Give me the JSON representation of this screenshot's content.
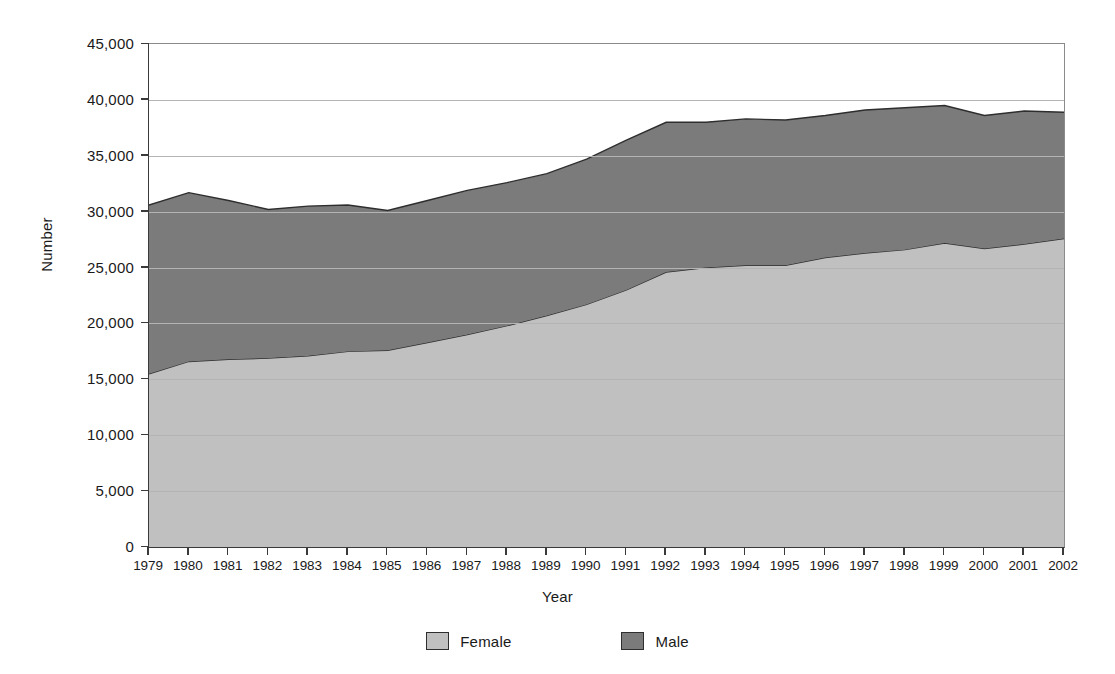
{
  "chart_data": {
    "type": "area",
    "stacked": true,
    "title": "",
    "xlabel": "Year",
    "ylabel": "Number",
    "grid": true,
    "legend_position": "bottom",
    "ylim": [
      0,
      45000
    ],
    "ytick_step": 5000,
    "ytick_labels": [
      "45,000",
      "40,000",
      "35,000",
      "30,000",
      "25,000",
      "20,000",
      "15,000",
      "10,000",
      "5,000",
      "0"
    ],
    "ytick_values": [
      45000,
      40000,
      35000,
      30000,
      25000,
      20000,
      15000,
      10000,
      5000,
      0
    ],
    "categories": [
      "1979",
      "1980",
      "1981",
      "1982",
      "1983",
      "1984",
      "1985",
      "1986",
      "1987",
      "1988",
      "1989",
      "1990",
      "1991",
      "1992",
      "1993",
      "1994",
      "1995",
      "1996",
      "1997",
      "1998",
      "1999",
      "2000",
      "2001",
      "2002"
    ],
    "series": [
      {
        "name": "Female",
        "color": "#c0c0c0",
        "values": [
          15500,
          16600,
          16800,
          16900,
          17100,
          17500,
          17600,
          18300,
          19000,
          19800,
          20700,
          21700,
          23000,
          24600,
          25000,
          25200,
          25200,
          25900,
          26300,
          26600,
          27200,
          26700,
          27100,
          27600
        ]
      },
      {
        "name": "Male",
        "color": "#7b7b7b",
        "values": [
          15100,
          15100,
          14200,
          13300,
          13400,
          13100,
          12500,
          12700,
          12900,
          12800,
          12700,
          13000,
          13400,
          13400,
          13000,
          13100,
          13000,
          12700,
          12800,
          12700,
          12300,
          11900,
          11900,
          11300
        ]
      }
    ],
    "totals": [
      30600,
      31700,
      31000,
      30200,
      30500,
      30600,
      30100,
      31000,
      31900,
      32600,
      33400,
      34700,
      36400,
      38000,
      38000,
      38300,
      38200,
      38600,
      39100,
      39300,
      39500,
      38600,
      39000,
      38900
    ]
  },
  "legend": {
    "items": [
      {
        "label": "Female",
        "color": "#c0c0c0"
      },
      {
        "label": "Male",
        "color": "#7b7b7b"
      }
    ]
  },
  "axes": {
    "y_title": "Number",
    "x_title": "Year"
  }
}
